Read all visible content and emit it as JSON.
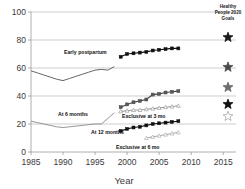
{
  "chart_data": {
    "type": "line",
    "title": "",
    "xlabel": "Year",
    "ylabel": "",
    "xlim": [
      1985,
      2017
    ],
    "ylim": [
      0,
      100
    ],
    "grid": true,
    "xticks": [
      "1985",
      "1990",
      "1995",
      "2000",
      "2005",
      "2010",
      "2015"
    ],
    "xtick_values": [
      1985,
      1990,
      1995,
      2000,
      2005,
      2010,
      2015
    ],
    "yticks": [
      "0",
      "20",
      "40",
      "60",
      "80",
      "100"
    ],
    "ytick_values": [
      0,
      20,
      40,
      60,
      80,
      100
    ],
    "legend_position": "top-right",
    "legend_title": "Healthy People 2020 Goals",
    "series": [
      {
        "name": "Early postpartum",
        "label": "Early postpartum",
        "marker": "none",
        "color": "#555555",
        "x": [
          1985,
          1986,
          1987,
          1988,
          1989,
          1990,
          1991,
          1992,
          1993,
          1994,
          1995,
          1996,
          1997,
          1998
        ],
        "values": [
          58,
          56.5,
          55,
          53.5,
          52,
          51,
          52.5,
          54,
          55.5,
          57,
          58.5,
          59,
          58.5,
          61
        ]
      },
      {
        "name": "Early postpartum (NIS)",
        "label": "",
        "marker": "square-filled",
        "color": "#111111",
        "x": [
          1999,
          2000,
          2001,
          2002,
          2003,
          2004,
          2005,
          2006,
          2007,
          2008
        ],
        "values": [
          68,
          70,
          70.5,
          71,
          71.5,
          72.5,
          73,
          73.5,
          74,
          74
        ]
      },
      {
        "name": "At 6 months",
        "label": "At 6 months",
        "marker": "none",
        "color": "#8a8a8a",
        "x": [
          1985,
          1986,
          1987,
          1988,
          1989,
          1990,
          1991,
          1992,
          1993,
          1994,
          1995,
          1996,
          1997,
          1998
        ],
        "values": [
          22,
          21,
          20,
          19,
          18,
          17.5,
          18,
          18.5,
          19,
          19.5,
          20,
          20,
          24,
          28
        ]
      },
      {
        "name": "At 6 months (NIS)",
        "label": "",
        "marker": "square-half",
        "color": "#444444",
        "x": [
          1999,
          2000,
          2001,
          2002,
          2003,
          2004,
          2005,
          2006,
          2007,
          2008
        ],
        "values": [
          32,
          34,
          35.5,
          36.5,
          37.5,
          41,
          41.5,
          42.5,
          43,
          43.5
        ]
      },
      {
        "name": "Exclusive at 3 mo",
        "label": "Exclusive at 3 mo",
        "marker": "triangle-open",
        "color": "#9d9d9d",
        "x": [
          1999,
          2000,
          2001,
          2002,
          2003,
          2004,
          2005,
          2006,
          2007,
          2008
        ],
        "values": [
          29,
          29.5,
          30,
          30,
          30.5,
          31,
          31.5,
          32,
          32.5,
          33
        ]
      },
      {
        "name": "At 12 months",
        "label": "At 12 months",
        "marker": "square-filled",
        "color": "#111111",
        "x": [
          1999,
          2000,
          2001,
          2002,
          2003,
          2004,
          2005,
          2006,
          2007,
          2008
        ],
        "values": [
          15,
          16.5,
          17.5,
          18,
          19,
          20,
          20.5,
          21,
          21.5,
          22
        ]
      },
      {
        "name": "Exclusive at 6 mo",
        "label": "Exclusive at 6 mo",
        "marker": "triangle-open",
        "color": "#b0b0b0",
        "x": [
          2003,
          2004,
          2005,
          2006,
          2007,
          2008
        ],
        "values": [
          10,
          10.8,
          11.6,
          12.4,
          13.2,
          14
        ]
      }
    ],
    "goal_markers": [
      {
        "name": "early-postpartum-goal",
        "value": 81.9,
        "style": "filled",
        "color": "#1a1a1a"
      },
      {
        "name": "at-6-months-goal",
        "value": 60.6,
        "style": "filled",
        "color": "#4a4a4a"
      },
      {
        "name": "exclusive-at-3-mo-goal",
        "value": 46.2,
        "style": "filled",
        "color": "#6d6d6d"
      },
      {
        "name": "at-12-months-goal",
        "value": 34.1,
        "style": "filled",
        "color": "#111111"
      },
      {
        "name": "exclusive-at-6-mo-goal",
        "value": 25.5,
        "style": "open",
        "color": "#a8a8a8"
      }
    ]
  }
}
